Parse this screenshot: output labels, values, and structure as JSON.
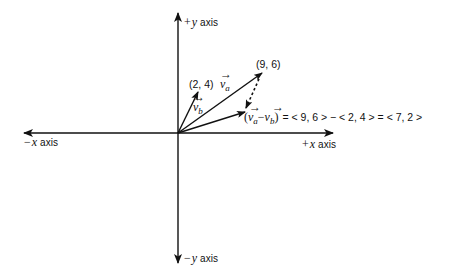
{
  "diagram": {
    "axes": {
      "pos_y": {
        "sign": "+",
        "var": "y",
        "word": "axis"
      },
      "neg_y": {
        "sign": "−",
        "var": "y",
        "word": "axis"
      },
      "pos_x": {
        "sign": "+",
        "var": "x",
        "word": "axis"
      },
      "neg_x": {
        "sign": "−",
        "var": "x",
        "word": "axis"
      }
    },
    "vectors": {
      "va": {
        "symbol": "v",
        "subscript": "a",
        "arrow": "→",
        "point_label": "(9, 6)",
        "components": [
          9,
          6
        ]
      },
      "vb": {
        "symbol": "v",
        "subscript": "b",
        "arrow": "→",
        "point_label": "(2, 4)",
        "components": [
          2,
          4
        ]
      },
      "difference": {
        "open": "(",
        "minus": "−",
        "close": ")",
        "equation_rest": "= < 9, 6 > − < 2, 4 > = < 7, 2 >",
        "components": [
          7,
          2
        ]
      }
    },
    "colors": {
      "ink": "#111111",
      "background": "#ffffff"
    }
  }
}
